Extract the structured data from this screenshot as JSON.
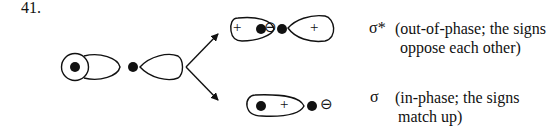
{
  "question_number": "41.",
  "sigma_star": {
    "symbol": "σ*",
    "description_line1": "(out-of-phase; the signs",
    "description_line2": "oppose each other)",
    "left_lobe_sign": "+",
    "right_lobe_sign": "+",
    "small_lobe_sign": "⊖"
  },
  "sigma": {
    "symbol": "σ",
    "description_line1": "(in-phase; the signs",
    "description_line2": "match up)",
    "lobe_sign": "+",
    "small_lobe_sign": "⊖"
  },
  "colors": {
    "stroke": "#111111",
    "background": "#ffffff"
  }
}
